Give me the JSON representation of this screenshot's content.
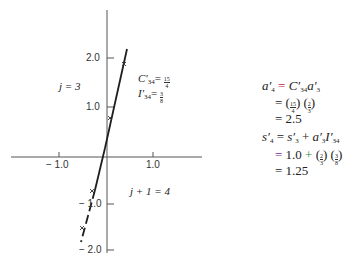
{
  "figure": {
    "axes": {
      "x_ticks": [
        {
          "value": -1.0,
          "label": "− 1.0"
        },
        {
          "value": 1.0,
          "label": "1.0"
        }
      ],
      "y_ticks": [
        {
          "value": 2.0,
          "label": "2.0"
        },
        {
          "value": 1.0,
          "label": "1.0"
        },
        {
          "value": -1.0,
          "label": "− 1.0"
        },
        {
          "value": -2.0,
          "label": "− 2.0"
        }
      ]
    },
    "region_labels": {
      "upper": "j = 3",
      "lower": "j + 1 = 4"
    },
    "params": {
      "C_name": "C′",
      "C_sub": "34",
      "C_num": "15",
      "C_den": "4",
      "I_name": "I′",
      "I_sub": "34",
      "I_num": "3",
      "I_den": "8"
    },
    "markers": [
      "x",
      "x",
      "x",
      "x"
    ]
  },
  "equations": {
    "a": {
      "line1_lhs": "a′",
      "line1_lhs_sub": "4",
      "line1_eq": "=",
      "line1_rhs_C": "C′",
      "line1_rhs_C_sub": "34",
      "line1_rhs_a": "a′",
      "line1_rhs_a_sub": "3",
      "line2_eq": "=",
      "line2_f1_num": "15",
      "line2_f1_den": "4",
      "line2_f2_num": "2",
      "line2_f2_den": "3",
      "line3_eq": "=",
      "line3_val": "2.5"
    },
    "s": {
      "line1_lhs": "s′",
      "line1_lhs_sub": "4",
      "line1_eq": "=",
      "line1_rhs_s": "s′",
      "line1_rhs_s_sub": "3",
      "line1_plus": "+",
      "line1_rhs_a": "a′",
      "line1_rhs_a_sub": "3",
      "line1_rhs_I": "I′",
      "line1_rhs_I_sub": "34",
      "line2_eq": "=",
      "line2_val": "1.0",
      "line2_plus": "+",
      "line2_f1_num": "2",
      "line2_f1_den": "3",
      "line2_f2_num": "3",
      "line2_f2_den": "8",
      "line3_eq": "=",
      "line3_val": "1.25"
    }
  },
  "colors": {
    "axis": "#555555",
    "line": "#1e1e1e",
    "eq_accent_red": "#c0284a",
    "eq_accent_purple": "#7a2a8a",
    "eq_accent_green": "#2f8a3a"
  }
}
